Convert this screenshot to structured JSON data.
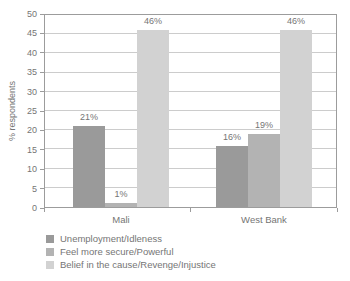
{
  "chart_data": {
    "type": "bar",
    "title": "",
    "ylabel": "% respondents",
    "ylim": [
      0,
      50
    ],
    "ytick_step": 5,
    "grid": true,
    "legend_position": "bottom-left",
    "value_label_suffix": "%",
    "categories": [
      "Mali",
      "West Bank"
    ],
    "series": [
      {
        "name": "Unemployment/Idleness",
        "color": "#9a9a9a",
        "values": [
          21,
          16
        ]
      },
      {
        "name": "Feel more secure/Powerful",
        "color": "#b3b3b3",
        "values": [
          1,
          19
        ]
      },
      {
        "name": "Belief in the cause/Revenge/Injustice",
        "color": "#d2d2d2",
        "values": [
          46,
          46
        ]
      }
    ],
    "axis_color": "#9c9c9c",
    "grid_color": "#cccccc",
    "text_color": "#757575"
  }
}
